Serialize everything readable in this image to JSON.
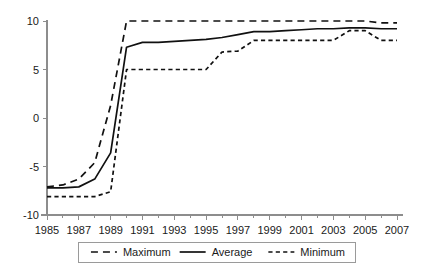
{
  "chart_data": {
    "type": "line",
    "title": "",
    "subtitle": "",
    "xlabel": "",
    "ylabel": "",
    "xlim": [
      1985,
      2007
    ],
    "ylim": [
      -10,
      10
    ],
    "grid": false,
    "legend_position": "bottom",
    "x": [
      1985,
      1986,
      1987,
      1988,
      1989,
      1990,
      1991,
      1992,
      1993,
      1994,
      1995,
      1996,
      1997,
      1998,
      1999,
      2000,
      2001,
      2002,
      2003,
      2004,
      2005,
      2006,
      2007
    ],
    "x_tick_labels": [
      "1985",
      "1987",
      "1989",
      "1991",
      "1993",
      "1995",
      "1997",
      "1999",
      "2001",
      "2003",
      "2005",
      "2007"
    ],
    "x_tick_values": [
      1985,
      1987,
      1989,
      1991,
      1993,
      1995,
      1997,
      1999,
      2001,
      2003,
      2005,
      2007
    ],
    "x_minor_tick_values": [
      1986,
      1988,
      1990,
      1992,
      1994,
      1996,
      1998,
      2000,
      2002,
      2004,
      2006
    ],
    "y_tick_labels": [
      "10",
      "5",
      "0",
      "-5",
      "-10"
    ],
    "y_tick_values": [
      10,
      5,
      0,
      -5,
      -10
    ],
    "series": [
      {
        "name": "Maximum",
        "style": "dashed-long",
        "color": "#111111",
        "values": [
          -7.1,
          -6.9,
          -6.3,
          -4.6,
          1.3,
          10.0,
          10.0,
          10.0,
          10.0,
          10.0,
          10.0,
          10.0,
          10.0,
          10.0,
          10.0,
          10.0,
          10.0,
          10.0,
          10.0,
          10.0,
          10.0,
          9.8,
          9.8
        ]
      },
      {
        "name": "Average",
        "style": "solid",
        "color": "#111111",
        "values": [
          -7.2,
          -7.2,
          -7.1,
          -6.3,
          -3.6,
          7.3,
          7.8,
          7.8,
          7.9,
          8.0,
          8.1,
          8.3,
          8.6,
          8.9,
          8.9,
          9.0,
          9.1,
          9.2,
          9.2,
          9.3,
          9.3,
          9.2,
          9.2
        ]
      },
      {
        "name": "Minimum",
        "style": "dashed-short",
        "color": "#111111",
        "values": [
          -8.1,
          -8.1,
          -8.1,
          -8.1,
          -7.6,
          5.0,
          5.0,
          5.0,
          5.0,
          5.0,
          5.0,
          6.8,
          6.9,
          8.0,
          8.0,
          8.0,
          8.0,
          8.0,
          8.0,
          9.0,
          9.0,
          8.0,
          8.0
        ]
      }
    ]
  },
  "legend": {
    "entries": [
      {
        "label": "Maximum",
        "style": "dashed-long"
      },
      {
        "label": "Average",
        "style": "solid"
      },
      {
        "label": "Minimum",
        "style": "dashed-short"
      }
    ]
  }
}
